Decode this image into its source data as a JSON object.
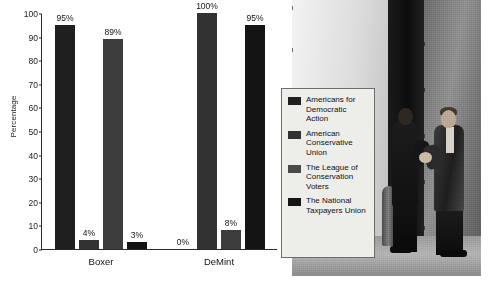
{
  "chart_data": {
    "type": "bar",
    "title": "",
    "xlabel": "",
    "ylabel": "Percentage",
    "ylim": [
      0,
      100
    ],
    "yticks": [
      0,
      10,
      20,
      30,
      40,
      50,
      60,
      70,
      80,
      90,
      100
    ],
    "grid": false,
    "legend_position": "right",
    "categories": [
      "Boxer",
      "DeMint"
    ],
    "series": [
      {
        "name": "Americans for Democratic Action",
        "values": [
          95,
          0
        ],
        "labels": [
          "95%",
          "0%"
        ],
        "color": "#201f1f"
      },
      {
        "name": "American Conservative Union",
        "values": [
          4,
          100
        ],
        "labels": [
          "4%",
          "100%"
        ],
        "color": "#333232"
      },
      {
        "name": "The League of Conservation Voters",
        "values": [
          89,
          8
        ],
        "labels": [
          "89%",
          "8%"
        ],
        "color": "#3d3c3c"
      },
      {
        "name": "The National Taxpayers Union",
        "values": [
          3,
          95
        ],
        "labels": [
          "3%",
          "95%"
        ],
        "color": "#141414"
      }
    ]
  },
  "legend": {
    "items": [
      {
        "label": "Americans for Democratic Action",
        "color": "#201f1f"
      },
      {
        "label": "American Conservative Union",
        "color": "#333232"
      },
      {
        "label": "The League of Conservation Voters",
        "color": "#4a4949"
      },
      {
        "label": "The National Taxpayers Union",
        "color": "#141414"
      }
    ]
  },
  "photo": {
    "caption": "Two men in suits shaking hands outside a stone building"
  }
}
